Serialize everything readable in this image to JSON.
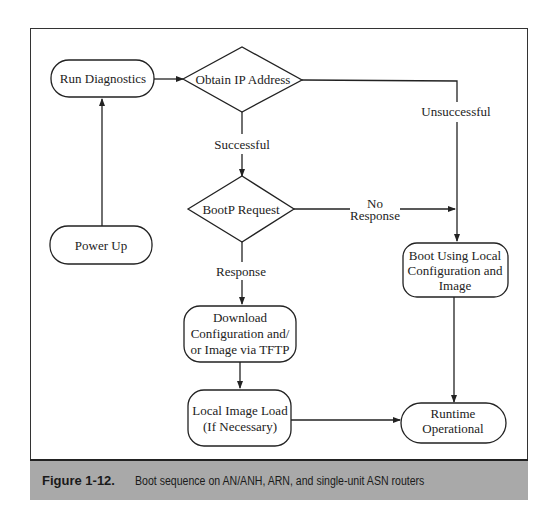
{
  "nodes": {
    "run_diagnostics": {
      "label": "Run Diagnostics"
    },
    "obtain_ip": {
      "label": "Obtain IP Address"
    },
    "bootp_request": {
      "label": "BootP Request"
    },
    "power_up": {
      "label": "Power Up"
    },
    "download_config": {
      "lines": [
        "Download",
        "Configuration and/",
        "or Image via TFTP"
      ]
    },
    "local_image_load": {
      "lines": [
        "Local Image Load",
        "(If Necessary)"
      ]
    },
    "boot_local": {
      "lines": [
        "Boot Using Local",
        "Configuration and",
        "Image"
      ]
    },
    "runtime": {
      "lines": [
        "Runtime",
        "Operational"
      ]
    }
  },
  "edges": {
    "successful": "Successful",
    "unsuccessful": "Unsuccessful",
    "no_response": [
      "No",
      "Response"
    ],
    "response": "Response"
  },
  "caption": {
    "number": "Figure 1-12.",
    "text": "Boot sequence on AN/ANH, ARN, and single-unit ASN routers"
  }
}
